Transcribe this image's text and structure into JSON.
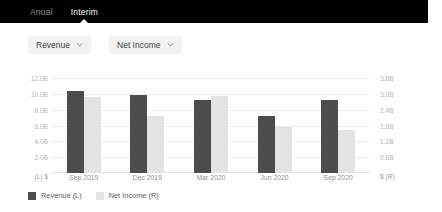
{
  "header": {
    "tabs": [
      {
        "label": "Anual",
        "active": false
      },
      {
        "label": "Interim",
        "active": true
      }
    ]
  },
  "controls": {
    "dropdowns": [
      {
        "label": "Revenue",
        "icon": "chevron-down-icon"
      },
      {
        "label": "Net Income",
        "icon": "chevron-down-icon"
      }
    ]
  },
  "legend": [
    {
      "label": "Revenue (L)",
      "color": "#4d4d4d"
    },
    {
      "label": "Net Income (R)",
      "color": "#e3e3e3"
    }
  ],
  "colors": {
    "revenue": "#4d4d4d",
    "net_income": "#e3e3e3",
    "header_bg": "#000000",
    "grid": "#ededed"
  },
  "chart_data": {
    "type": "bar",
    "title": "",
    "xlabel": "",
    "grid": true,
    "legend_position": "bottom-left",
    "categories": [
      "Sep 2019",
      "Dec 2019",
      "Mar 2020",
      "Jun 2020",
      "Sep 2020"
    ],
    "series": [
      {
        "name": "Revenue (L)",
        "axis": "left",
        "unit": "$ (L)",
        "color": "#4d4d4d",
        "values": [
          10.4,
          9.9,
          9.3,
          7.2,
          9.2
        ]
      },
      {
        "name": "Net Income (R)",
        "axis": "right",
        "unit": "$ (R)",
        "color": "#e3e3e3",
        "values": [
          2.88,
          2.16,
          2.94,
          1.74,
          1.62
        ]
      }
    ],
    "left_axis": {
      "label": "(L)  $",
      "unit_suffix": "B",
      "ticks": [
        "12.0B",
        "10.0B",
        "8.0B",
        "6.0B",
        "4.0B",
        "2.0B"
      ],
      "tick_values": [
        12,
        10,
        8,
        6,
        4,
        2
      ],
      "ylim": [
        0,
        12.8
      ]
    },
    "right_axis": {
      "label": "$  (R)",
      "unit_suffix": "B",
      "ticks": [
        "3.6B",
        "3.0B",
        "2.4B",
        "1.8B",
        "1.2B",
        "0.6B"
      ],
      "tick_values": [
        3.6,
        3.0,
        2.4,
        1.8,
        1.2,
        0.6
      ],
      "ylim": [
        0,
        3.84
      ]
    }
  }
}
